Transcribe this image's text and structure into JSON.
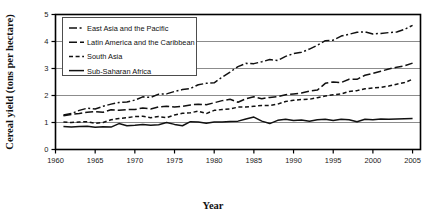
{
  "chart_data": {
    "type": "line",
    "title": "",
    "xlabel": "Year",
    "ylabel": "Cereal yield (tons per hectare)",
    "xlim": [
      1960,
      2006
    ],
    "ylim": [
      0,
      5
    ],
    "xticks": [
      1960,
      1965,
      1970,
      1975,
      1980,
      1985,
      1990,
      1995,
      2000,
      2005
    ],
    "yticks": [
      0,
      1,
      2,
      3,
      4,
      5
    ],
    "xtick_labels": [
      "1960",
      "1965",
      "1970",
      "1975",
      "1980",
      "1985",
      "1990",
      "1995",
      "2000",
      "2005"
    ],
    "ytick_labels": [
      "0",
      "1",
      "2",
      "3",
      "4",
      "5"
    ],
    "grid": "horizontal",
    "legend_position": "top-left-inside",
    "x": [
      1961,
      1962,
      1963,
      1964,
      1965,
      1966,
      1967,
      1968,
      1969,
      1970,
      1971,
      1972,
      1973,
      1974,
      1975,
      1976,
      1977,
      1978,
      1979,
      1980,
      1981,
      1982,
      1983,
      1984,
      1985,
      1986,
      1987,
      1988,
      1989,
      1990,
      1991,
      1992,
      1993,
      1994,
      1995,
      1996,
      1997,
      1998,
      1999,
      2000,
      2001,
      2002,
      2003,
      2004,
      2005
    ],
    "series": [
      {
        "name": "East Asia and the Pacific",
        "line_style": "dash-dot",
        "color": "#111111",
        "values": [
          1.28,
          1.33,
          1.45,
          1.53,
          1.5,
          1.6,
          1.68,
          1.74,
          1.76,
          1.83,
          1.95,
          1.93,
          2.05,
          2.06,
          2.15,
          2.22,
          2.26,
          2.4,
          2.45,
          2.47,
          2.68,
          2.87,
          3.07,
          3.19,
          3.18,
          3.25,
          3.33,
          3.3,
          3.45,
          3.55,
          3.6,
          3.72,
          3.86,
          4.03,
          4.05,
          4.2,
          4.27,
          4.34,
          4.36,
          4.28,
          4.3,
          4.33,
          4.35,
          4.45,
          4.6
        ]
      },
      {
        "name": "Latin America and the Caribbean",
        "line_style": "long-dash",
        "color": "#111111",
        "values": [
          1.25,
          1.3,
          1.33,
          1.38,
          1.4,
          1.38,
          1.47,
          1.45,
          1.48,
          1.48,
          1.54,
          1.5,
          1.58,
          1.6,
          1.57,
          1.6,
          1.65,
          1.68,
          1.66,
          1.73,
          1.81,
          1.86,
          1.75,
          1.88,
          1.95,
          1.88,
          1.93,
          1.96,
          2.03,
          2.06,
          2.09,
          2.16,
          2.2,
          2.45,
          2.5,
          2.48,
          2.6,
          2.6,
          2.75,
          2.82,
          2.9,
          2.98,
          3.05,
          3.1,
          3.2
        ]
      },
      {
        "name": "South Asia",
        "line_style": "short-dash",
        "color": "#111111",
        "values": [
          1.02,
          1.0,
          1.02,
          1.03,
          0.97,
          1.0,
          1.1,
          1.15,
          1.18,
          1.22,
          1.23,
          1.18,
          1.22,
          1.18,
          1.28,
          1.34,
          1.36,
          1.42,
          1.33,
          1.45,
          1.48,
          1.5,
          1.57,
          1.57,
          1.6,
          1.63,
          1.63,
          1.68,
          1.78,
          1.82,
          1.85,
          1.86,
          1.92,
          1.98,
          2.03,
          2.06,
          2.15,
          2.18,
          2.25,
          2.28,
          2.3,
          2.35,
          2.42,
          2.48,
          2.6
        ]
      },
      {
        "name": "Sub-Saharan Africa",
        "line_style": "solid",
        "color": "#111111",
        "values": [
          0.85,
          0.83,
          0.85,
          0.86,
          0.82,
          0.84,
          0.83,
          0.96,
          0.88,
          0.9,
          0.93,
          0.9,
          0.92,
          1.0,
          0.93,
          0.88,
          1.03,
          1.02,
          0.97,
          1.02,
          1.02,
          1.04,
          1.05,
          1.13,
          1.2,
          1.05,
          0.96,
          1.08,
          1.12,
          1.07,
          1.09,
          1.05,
          1.1,
          1.12,
          1.07,
          1.12,
          1.1,
          1.03,
          1.12,
          1.1,
          1.13,
          1.12,
          1.13,
          1.14,
          1.15
        ]
      }
    ]
  },
  "legend": {
    "items": [
      {
        "label": "East Asia and the Pacific",
        "style": "dash-dot"
      },
      {
        "label": "Latin America and the Caribbean",
        "style": "long-dash"
      },
      {
        "label": "South Asia",
        "style": "short-dash"
      },
      {
        "label": "Sub-Saharan Africa",
        "style": "solid"
      }
    ]
  },
  "style": {
    "line_color": "#111111",
    "grid_color": "#8c8c8c",
    "axis_color": "#000000",
    "background": "#ffffff"
  }
}
